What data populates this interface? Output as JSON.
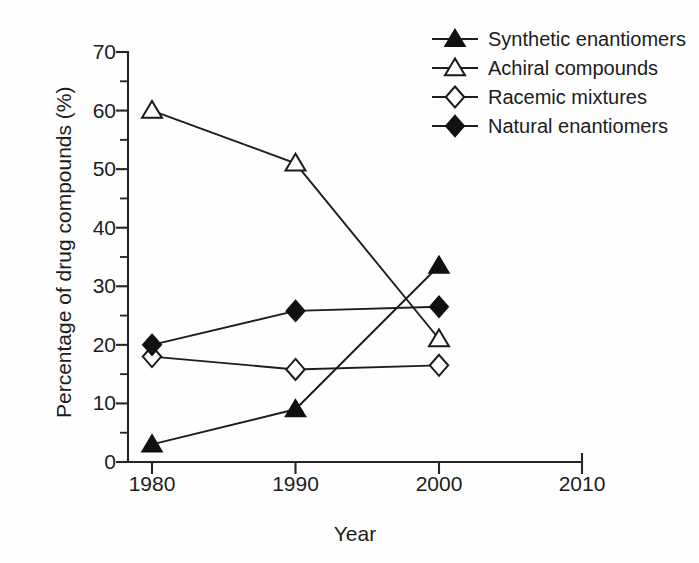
{
  "chart_data": {
    "type": "line",
    "title": "",
    "xlabel": "Year",
    "ylabel": "Percentage of drug compounds (%)",
    "x": [
      1980,
      1990,
      2000
    ],
    "xlim": [
      1980,
      2010
    ],
    "ylim": [
      0,
      70
    ],
    "xticks": [
      "1980",
      "1990",
      "2000",
      "2010"
    ],
    "yticks": [
      "0",
      "10",
      "20",
      "30",
      "40",
      "50",
      "60",
      "70"
    ],
    "yticks_minor": [
      5,
      15,
      25,
      35,
      45,
      55,
      65
    ],
    "grid": false,
    "legend_position": "top-right",
    "series": [
      {
        "name": "Synthetic enantiomers",
        "marker": "filled-triangle",
        "values": [
          3,
          9,
          33.5
        ]
      },
      {
        "name": "Achiral compounds",
        "marker": "open-triangle",
        "values": [
          60,
          51,
          21
        ]
      },
      {
        "name": "Racemic mixtures",
        "marker": "open-diamond",
        "values": [
          18,
          15.8,
          16.5
        ]
      },
      {
        "name": "Natural enantiomers",
        "marker": "filled-diamond",
        "values": [
          20,
          25.8,
          26.5
        ]
      }
    ]
  },
  "colors": {
    "ink": "#1a1a1a",
    "background": "#ffffff",
    "marker_fill": "#111111",
    "marker_open_fill": "#ffffff"
  }
}
